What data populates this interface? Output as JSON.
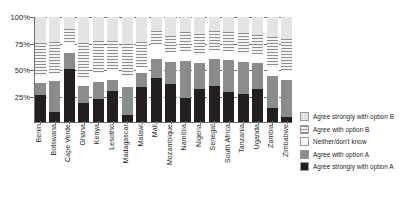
{
  "chart_data": {
    "type": "bar",
    "subtype": "stacked-100-percent",
    "title": "",
    "xlabel": "",
    "ylabel": "",
    "ylim": [
      0,
      100
    ],
    "yticks": [
      "0%",
      "25%",
      "50%",
      "75%",
      "100%"
    ],
    "ytick_values": [
      0,
      25,
      50,
      75,
      100
    ],
    "grid": true,
    "legend_position": "right",
    "categories": [
      "Benin",
      "Botswana",
      "Cape Verde",
      "Ghana",
      "Kenya",
      "Lesotho",
      "Madagascar",
      "Malawi",
      "Mali",
      "Mozambique",
      "Namibia",
      "Nigeria",
      "Senegal",
      "South Africa",
      "Tanzania",
      "Uganda",
      "Zambia",
      "Zimbabwe"
    ],
    "series": [
      {
        "name": "Agree strongly with option A",
        "key": "sa",
        "color": "#231f20",
        "values": [
          26,
          10,
          50,
          18,
          22,
          30,
          7,
          33,
          42,
          36,
          23,
          31,
          34,
          29,
          27,
          31,
          13,
          5
        ]
      },
      {
        "name": "Agree with option A",
        "key": "a",
        "color": "#8a8c8e",
        "values": [
          11,
          29,
          16,
          16,
          16,
          10,
          26,
          14,
          18,
          21,
          35,
          25,
          26,
          30,
          30,
          25,
          31,
          35
        ]
      },
      {
        "name": "Neither/don't know",
        "key": "n",
        "color": "#ffffff",
        "values": [
          7,
          8,
          9,
          7,
          9,
          10,
          11,
          5,
          13,
          10,
          10,
          8,
          8,
          9,
          8,
          9,
          8,
          9
        ]
      },
      {
        "name": "Agree with option B",
        "key": "b",
        "color": "#f4f4f4",
        "values": [
          31,
          29,
          14,
          34,
          30,
          27,
          30,
          24,
          14,
          15,
          18,
          20,
          19,
          18,
          20,
          18,
          29,
          30
        ]
      },
      {
        "name": "Agree strongly with option B",
        "key": "sb",
        "color": "#e4e4e4",
        "values": [
          25,
          24,
          11,
          25,
          23,
          23,
          26,
          24,
          13,
          18,
          14,
          16,
          13,
          14,
          15,
          17,
          19,
          21
        ]
      }
    ]
  },
  "legend": {
    "items": [
      {
        "label": "Agree strongly with option B",
        "key": "sb"
      },
      {
        "label": "Agree with option B",
        "key": "b"
      },
      {
        "label": "Neither/don't know",
        "key": "n"
      },
      {
        "label": "Agree with option A",
        "key": "a"
      },
      {
        "label": "Agree strongly with option A",
        "key": "sa"
      }
    ]
  }
}
